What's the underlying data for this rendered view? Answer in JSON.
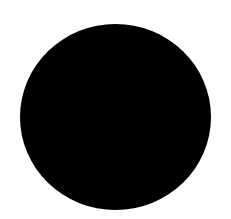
{
  "canvas": {
    "width": 231,
    "height": 219,
    "background_color": "#ffffff"
  },
  "shape": {
    "type": "filled-circle",
    "fill_color": "#000000",
    "center_x": 115.5,
    "center_y": 117,
    "width": 191,
    "height": 186
  }
}
